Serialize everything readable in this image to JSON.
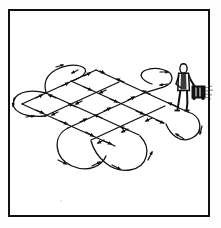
{
  "figure": {
    "kind": "line-art-illustration",
    "caption": "",
    "has_text_labels": false
  },
  "style": {
    "ink_color": "#111111",
    "paper_color": "#ffffff",
    "frame_color": "#111111",
    "frame_stroke_px": 2,
    "path_stroke_px": 1.6,
    "loop_stroke_px": 1.5
  },
  "frame": {
    "x": 8,
    "y": 9,
    "width": 202,
    "height": 208
  },
  "lawn": {
    "shape": "parallelogram",
    "corners": [
      {
        "name": "left",
        "x": 22,
        "y": 104
      },
      {
        "name": "top",
        "x": 96,
        "y": 70
      },
      {
        "name": "right",
        "x": 188,
        "y": 103
      },
      {
        "name": "bottom",
        "x": 115,
        "y": 146
      }
    ]
  },
  "mower_figure": {
    "name": "person-pushing-mower",
    "person": {
      "head": {
        "cx": 183.5,
        "cy": 68.5,
        "rx": 3.4,
        "ry": 4.4
      },
      "torso": {
        "x": 178.5,
        "y": 73.0,
        "w": 10.0,
        "h": 17.0
      },
      "legs_bottom_y": 110.0,
      "arm_to_handle": true
    },
    "mower": {
      "body": {
        "x": 192.0,
        "y": 86.0,
        "w": 13.0,
        "h": 12.0
      },
      "handle_from": {
        "x": 190.0,
        "y": 80.0
      },
      "handle_to": {
        "x": 196.0,
        "y": 88.0
      },
      "discharge_spray": true
    }
  },
  "path_pattern": {
    "type": "cross-hatch-boustrophedon",
    "direction_marks": "solid triangular arrowheads",
    "pass_sets": [
      {
        "name": "set-a-passes",
        "count": 4,
        "bearing": "upper-left to lower-right",
        "lines": [
          {
            "x1": 22,
            "y1": 104,
            "x2": 96,
            "y2": 70
          },
          {
            "x1": 45,
            "y1": 116,
            "x2": 119,
            "y2": 82
          },
          {
            "x1": 68,
            "y1": 128,
            "x2": 142,
            "y2": 94
          },
          {
            "x1": 91,
            "y1": 140,
            "x2": 165,
            "y2": 106
          }
        ]
      },
      {
        "name": "set-b-passes",
        "count": 4,
        "bearing": "lower-left to upper-right",
        "lines": [
          {
            "x1": 22,
            "y1": 104,
            "x2": 115,
            "y2": 146
          },
          {
            "x1": 46,
            "y1": 93,
            "x2": 139,
            "y2": 135
          },
          {
            "x1": 71,
            "y1": 81,
            "x2": 164,
            "y2": 123
          },
          {
            "x1": 96,
            "y1": 70,
            "x2": 188,
            "y2": 112
          }
        ]
      }
    ],
    "turn_loops": [
      {
        "name": "loop-top-left",
        "cx": 58,
        "cy": 75,
        "rx": 17,
        "ry": 9,
        "rot": -25
      },
      {
        "name": "loop-far-left",
        "cx": 24,
        "cy": 110,
        "rx": 15,
        "ry": 12,
        "rot": 20
      },
      {
        "name": "loop-bottom-left",
        "cx": 82,
        "cy": 156,
        "rx": 18,
        "ry": 13,
        "rot": 25
      },
      {
        "name": "loop-bottom-right",
        "cx": 130,
        "cy": 160,
        "rx": 18,
        "ry": 13,
        "rot": -20
      },
      {
        "name": "loop-top-right",
        "cx": 158,
        "cy": 84,
        "rx": 16,
        "ry": 9,
        "rot": 20
      },
      {
        "name": "loop-far-right",
        "cx": 190,
        "cy": 122,
        "rx": 14,
        "ry": 11,
        "rot": -15
      }
    ],
    "arrow_count_approx": 46
  }
}
